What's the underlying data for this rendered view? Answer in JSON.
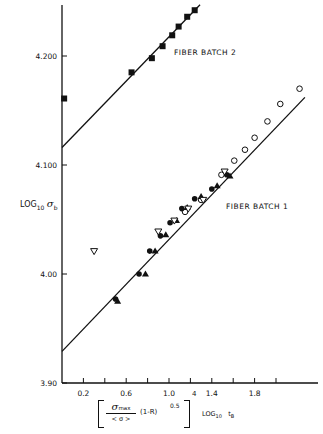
{
  "chart_data": {
    "type": "scatter",
    "title": "",
    "xlabel": "[ (σmax / <σ>) (1-R)^0.5 ]^4 LOG10 tB",
    "ylabel": "LOG10 σb",
    "xlim": [
      0,
      2.4
    ],
    "ylim": [
      3.9,
      4.25
    ],
    "grid": false,
    "x_ticks": [
      0.2,
      0.4,
      0.6,
      0.8,
      1.0,
      1.2,
      1.4,
      1.6,
      1.8,
      2.0
    ],
    "x_tick_labels": [
      "0.2",
      "",
      "0.6",
      "",
      "1.0",
      "",
      "1.4",
      "",
      "1.8",
      ""
    ],
    "y_ticks": [
      3.9,
      4.0,
      4.1,
      4.2
    ],
    "y_tick_labels": [
      "3.90",
      "4.00",
      "4.100",
      "4.200"
    ],
    "annotations": [
      "FIBER BATCH 2",
      "FIBER BATCH 1"
    ],
    "fit_lines": [
      {
        "name": "FIBER BATCH 2",
        "x": [
          0.0,
          1.29
        ],
        "y": [
          4.116,
          4.247
        ]
      },
      {
        "name": "FIBER BATCH 1",
        "x": [
          0.0,
          2.27
        ],
        "y": [
          3.929,
          4.162
        ]
      }
    ],
    "series": [
      {
        "name": "Batch 2 (filled squares)",
        "marker": "square-filled",
        "x": [
          0.02,
          0.65,
          0.84,
          0.94,
          1.03,
          1.09,
          1.17,
          1.24
        ],
        "y": [
          4.161,
          4.185,
          4.198,
          4.209,
          4.219,
          4.227,
          4.236,
          4.242
        ]
      },
      {
        "name": "Batch 1 (open circles)",
        "marker": "circle-open",
        "x": [
          1.15,
          1.3,
          1.49,
          1.61,
          1.71,
          1.8,
          1.92,
          2.04,
          2.22
        ],
        "y": [
          4.057,
          4.068,
          4.091,
          4.104,
          4.114,
          4.125,
          4.14,
          4.156,
          4.17
        ]
      },
      {
        "name": "Batch 1 (filled circles)",
        "marker": "circle-filled",
        "x": [
          0.5,
          0.72,
          0.82,
          0.92,
          1.01,
          1.12,
          1.24,
          1.4,
          1.54
        ],
        "y": [
          3.977,
          4.0,
          4.021,
          4.035,
          4.047,
          4.06,
          4.069,
          4.078,
          4.091
        ]
      },
      {
        "name": "Batch 1 (filled triangles)",
        "marker": "triangle-filled",
        "x": [
          0.52,
          0.78,
          0.87,
          0.97,
          1.07,
          1.17,
          1.3,
          1.45,
          1.57
        ],
        "y": [
          3.975,
          4.0,
          4.021,
          4.036,
          4.049,
          4.061,
          4.071,
          4.081,
          4.09
        ]
      },
      {
        "name": "Batch 1 (open triangles)",
        "marker": "triangle-open",
        "x": [
          0.3,
          0.9,
          1.05,
          1.18,
          1.32,
          1.52
        ],
        "y": [
          4.021,
          4.039,
          4.049,
          4.06,
          4.068,
          4.094
        ]
      }
    ]
  },
  "labels": {
    "y_axis": "LOG",
    "y_axis_sub": "10",
    "y_axis_sym": "σ",
    "y_axis_symsub": "b",
    "x_num_sym": "σ",
    "x_num_sub": "max",
    "x_den": "< σ >",
    "x_mid": "(1-R)",
    "x_exp05": "0.5",
    "x_exp4": "4",
    "x_log": "LOG",
    "x_log_sub": "10",
    "x_tb": "t",
    "x_tb_sub": "B"
  }
}
